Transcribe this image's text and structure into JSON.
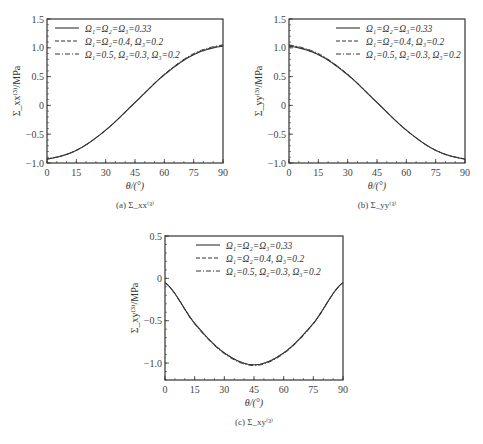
{
  "legend": [
    {
      "label": "Ω₁=Ω₂=Ω₃=0.33",
      "style": "solid"
    },
    {
      "label": "Ω₁=Ω₂=0.4, Ω₃=0.2",
      "style": "dashed"
    },
    {
      "label": "Ω₁=0.5, Ω₂=0.3, Ω₃=0.2",
      "style": "dashdot"
    }
  ],
  "xlabel": "θ/(°)",
  "ylabel": "Σ⁽³⁾/MPa",
  "chart_data": [
    {
      "type": "line",
      "id": "a",
      "caption": "(a) Σ_xx⁽³⁾",
      "xlabel": "θ/(°)",
      "ylabel": "Σ_xx⁽³⁾/MPa",
      "xlim": [
        0,
        90
      ],
      "ylim": [
        -1.0,
        1.5
      ],
      "xticks": [
        0,
        15,
        30,
        45,
        60,
        75,
        90
      ],
      "yticks": [
        -1.0,
        -0.5,
        0,
        0.5,
        1.0,
        1.5
      ],
      "ytick_labels": [
        "-1.0",
        "-0.5",
        "0",
        "0.5",
        "1.0",
        "1.5"
      ],
      "x": [
        0,
        15,
        30,
        45,
        60,
        75,
        90
      ],
      "series": [
        {
          "name": "Ω₁=Ω₂=Ω₃=0.33",
          "values": [
            -0.93,
            -0.78,
            -0.43,
            0.05,
            0.53,
            0.88,
            1.03
          ]
        },
        {
          "name": "Ω₁=Ω₂=0.4, Ω₃=0.2",
          "values": [
            -0.93,
            -0.78,
            -0.43,
            0.05,
            0.54,
            0.89,
            1.04
          ]
        },
        {
          "name": "Ω₁=0.5, Ω₂=0.3, Ω₃=0.2",
          "values": [
            -0.93,
            -0.78,
            -0.43,
            0.05,
            0.54,
            0.9,
            1.05
          ]
        }
      ],
      "legend_position": "upper left"
    },
    {
      "type": "line",
      "id": "b",
      "caption": "(b) Σ_yy⁽³⁾",
      "xlabel": "θ/(°)",
      "ylabel": "Σ_yy⁽³⁾/MPa",
      "xlim": [
        0,
        90
      ],
      "ylim": [
        -1.0,
        1.5
      ],
      "xticks": [
        0,
        15,
        30,
        45,
        60,
        75,
        90
      ],
      "yticks": [
        -1.0,
        -0.5,
        0,
        0.5,
        1.0,
        1.5
      ],
      "ytick_labels": [
        "-1.0",
        "-0.5",
        "0",
        "0.5",
        "1.0",
        "1.5"
      ],
      "x": [
        0,
        15,
        30,
        45,
        60,
        75,
        90
      ],
      "series": [
        {
          "name": "Ω₁=Ω₂=Ω₃=0.33",
          "values": [
            1.03,
            0.88,
            0.53,
            0.05,
            -0.43,
            -0.78,
            -0.93
          ]
        },
        {
          "name": "Ω₁=Ω₂=0.4, Ω₃=0.2",
          "values": [
            1.04,
            0.89,
            0.54,
            0.05,
            -0.43,
            -0.78,
            -0.93
          ]
        },
        {
          "name": "Ω₁=0.5, Ω₂=0.3, Ω₃=0.2",
          "values": [
            1.05,
            0.9,
            0.54,
            0.05,
            -0.43,
            -0.78,
            -0.93
          ]
        }
      ],
      "legend_position": "upper right"
    },
    {
      "type": "line",
      "id": "c",
      "caption": "(c) Σ_xy⁽³⁾",
      "xlabel": "θ/(°)",
      "ylabel": "Σ_xy⁽³⁾/MPa",
      "xlim": [
        0,
        90
      ],
      "ylim": [
        -1.2,
        0.5
      ],
      "xticks": [
        0,
        15,
        30,
        45,
        60,
        75,
        90
      ],
      "yticks": [
        -1.0,
        -0.5,
        0,
        0.5
      ],
      "ytick_labels": [
        "-1.0",
        "-0.5",
        "0",
        "0.5"
      ],
      "x": [
        0,
        15,
        30,
        45,
        60,
        75,
        90
      ],
      "series": [
        {
          "name": "Ω₁=Ω₂=Ω₃=0.33",
          "values": [
            -0.05,
            -0.53,
            -0.88,
            -1.02,
            -0.88,
            -0.53,
            -0.05
          ]
        },
        {
          "name": "Ω₁=Ω₂=0.4, Ω₃=0.2",
          "values": [
            -0.05,
            -0.53,
            -0.88,
            -1.02,
            -0.88,
            -0.53,
            -0.05
          ]
        },
        {
          "name": "Ω₁=0.5, Ω₂=0.3, Ω₃=0.2",
          "values": [
            -0.05,
            -0.54,
            -0.89,
            -1.03,
            -0.89,
            -0.54,
            -0.05
          ]
        }
      ],
      "legend_position": "upper center"
    }
  ]
}
